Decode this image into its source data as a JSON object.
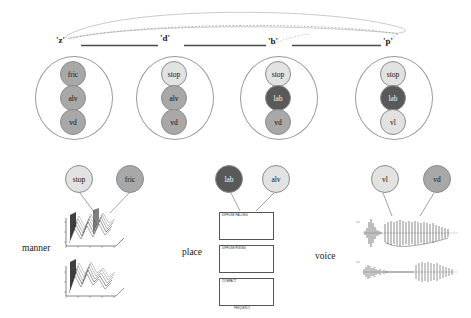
{
  "figure": {
    "type": "phonological-feature-network-diagram",
    "background_color": "#ffffff"
  },
  "colors": {
    "node_light": "#e2e2e2",
    "node_mid": "#a8a8a8",
    "node_dark": "#595959",
    "ellipse_stroke": "#9a9a9a",
    "link": "#6f6f6f",
    "text": "#111111"
  },
  "top_layer": {
    "description": "lexical/word level with dashed and solid linking arcs",
    "words": [
      {
        "label": "'z'",
        "x": 62,
        "y": 41
      },
      {
        "label": "'d'",
        "x": 163,
        "y": 38
      },
      {
        "label": "'b'",
        "x": 271,
        "y": 41
      },
      {
        "label": "'p'",
        "x": 386,
        "y": 42
      }
    ],
    "connector_bars": [
      {
        "x1": 81,
        "x2": 158,
        "y": 45
      },
      {
        "x1": 184,
        "x2": 266,
        "y": 45
      },
      {
        "x1": 291,
        "x2": 381,
        "y": 45
      }
    ]
  },
  "segments": [
    {
      "id": "z",
      "word": "'z'",
      "cx": 73,
      "cy": 97,
      "rx": 38,
      "ry": 41,
      "features": [
        {
          "label": "fric",
          "shade": "node_mid",
          "cy": 74,
          "r": 13
        },
        {
          "label": "alv",
          "shade": "node_mid",
          "cy": 98,
          "r": 13
        },
        {
          "label": "vd",
          "shade": "node_mid",
          "cy": 122,
          "r": 13
        }
      ]
    },
    {
      "id": "d",
      "word": "'d'",
      "cx": 174,
      "cy": 97,
      "rx": 38,
      "ry": 41,
      "features": [
        {
          "label": "stop",
          "shade": "node_light",
          "cy": 74,
          "r": 13
        },
        {
          "label": "alv",
          "shade": "node_mid",
          "cy": 98,
          "r": 13
        },
        {
          "label": "vd",
          "shade": "node_mid",
          "cy": 122,
          "r": 13
        }
      ]
    },
    {
      "id": "b",
      "word": "'b'",
      "cx": 278,
      "cy": 97,
      "rx": 38,
      "ry": 41,
      "features": [
        {
          "label": "stop",
          "shade": "node_light",
          "cy": 74,
          "r": 13
        },
        {
          "label": "lab",
          "shade": "node_dark",
          "cy": 98,
          "r": 13
        },
        {
          "label": "vd",
          "shade": "node_mid",
          "cy": 122,
          "r": 13
        }
      ]
    },
    {
      "id": "p",
      "word": "'p'",
      "cx": 393,
      "cy": 97,
      "rx": 38,
      "ry": 41,
      "features": [
        {
          "label": "stop",
          "shade": "node_light",
          "cy": 74,
          "r": 13
        },
        {
          "label": "lab",
          "shade": "node_dark",
          "cy": 98,
          "r": 13
        },
        {
          "label": "vl",
          "shade": "node_light",
          "cy": 122,
          "r": 13
        }
      ]
    }
  ],
  "categories": [
    {
      "name": "manner",
      "label": "manner",
      "label_x": 22,
      "label_y": 248,
      "nodes": [
        {
          "label": "stop",
          "shade": "node_light",
          "cx": 79,
          "cy": 179,
          "r": 14
        },
        {
          "label": "fric",
          "shade": "node_mid",
          "cx": 130,
          "cy": 179,
          "r": 14
        }
      ],
      "evidence_type": "spectral-surface-plots",
      "panels": [
        {
          "title": "",
          "xlabel": "time",
          "ylabel": "dB",
          "x": 57,
          "y": 206,
          "w": 64,
          "h": 42
        },
        {
          "title": "",
          "xlabel": "time",
          "ylabel": "dB",
          "x": 57,
          "y": 255,
          "w": 64,
          "h": 42
        }
      ]
    },
    {
      "name": "place",
      "label": "place",
      "label_x": 182,
      "label_y": 252,
      "nodes": [
        {
          "label": "lab",
          "shade": "node_dark",
          "cx": 229,
          "cy": 179,
          "r": 14
        },
        {
          "label": "alv",
          "shade": "node_light",
          "cx": 276,
          "cy": 179,
          "r": 14
        }
      ],
      "evidence_type": "line-plots",
      "panels": [
        {
          "title": "DIFFUSE FALLING",
          "xlabel": "",
          "x": 219,
          "y": 212,
          "w": 55,
          "h": 28,
          "plot": "wavy"
        },
        {
          "title": "DIFFUSE RISING",
          "xlabel": "",
          "x": 219,
          "y": 245,
          "w": 55,
          "h": 28,
          "plot": "rising"
        },
        {
          "title": "COMPACT",
          "xlabel": "FREQUENCY",
          "x": 219,
          "y": 278,
          "w": 55,
          "h": 28,
          "plot": "peak"
        }
      ]
    },
    {
      "name": "voice",
      "label": "voice",
      "label_x": 315,
      "label_y": 256,
      "nodes": [
        {
          "label": "vl",
          "shade": "node_light",
          "cx": 385,
          "cy": 179,
          "r": 14
        },
        {
          "label": "vd",
          "shade": "node_mid",
          "cx": 437,
          "cy": 179,
          "r": 14
        }
      ],
      "evidence_type": "waveform-plots",
      "panels": [
        {
          "title": "",
          "xlabel": "",
          "x": 360,
          "y": 218,
          "w": 95,
          "h": 32,
          "plot": "burst-long-vot"
        },
        {
          "title": "",
          "xlabel": "",
          "x": 360,
          "y": 256,
          "w": 95,
          "h": 30,
          "plot": "burst-short-vot"
        }
      ]
    }
  ]
}
